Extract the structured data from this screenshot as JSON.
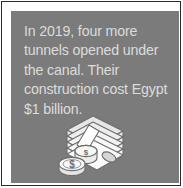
{
  "figure": {
    "card_background_color": "#7b7b7b",
    "frame_border_color": "#2b2b2b",
    "mat_color": "#ffffff",
    "text_color": "#dcdcdc",
    "illustration_color": "#e8e8e8"
  },
  "callout": {
    "text": "In 2019, four more tunnels opened under the canal. Their construction cost Egypt $1 billion.",
    "lines": [
      "In 2019, four more",
      "tunnels opened",
      "under the canal. Their",
      "construction cost",
      "Egypt $1 billion."
    ],
    "year": "2019",
    "tunnel_count": "four",
    "cost": "$1 billion",
    "country": "Egypt"
  },
  "illustration": {
    "name": "money-stack-icon",
    "description": "stack of banknotes with two dollar coins",
    "coin_symbol": "$"
  }
}
